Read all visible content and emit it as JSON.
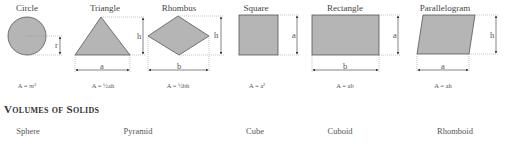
{
  "areas": {
    "shapes": [
      {
        "name": "Circle",
        "formula": "A = πr²",
        "labels": [
          "r"
        ]
      },
      {
        "name": "Triangle",
        "formula": "A = ½ah",
        "labels": [
          "h",
          "a"
        ]
      },
      {
        "name": "Rhombus",
        "formula": "A = ½bh",
        "labels": [
          "h",
          "b"
        ]
      },
      {
        "name": "Square",
        "formula": "A = a²",
        "labels": [
          "a"
        ]
      },
      {
        "name": "Rectangle",
        "formula": "A = ab",
        "labels": [
          "a",
          "b"
        ]
      },
      {
        "name": "Parallelogram",
        "formula": "A = ah",
        "labels": [
          "h",
          "a"
        ]
      }
    ]
  },
  "volumes": {
    "heading": "Volumes of Solids",
    "solids": [
      "Sphere",
      "Pyramid",
      "Cube",
      "Cuboid",
      "Rhomboid"
    ]
  },
  "colors": {
    "shape_fill": "#b5b5b5",
    "shape_stroke": "#555555",
    "guide": "#888888"
  }
}
